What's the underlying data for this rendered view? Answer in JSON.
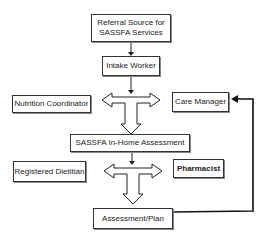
{
  "diagram": {
    "nodes": {
      "referral": {
        "label_line1": "Referral Source for",
        "label_line2": "SASSFA Services"
      },
      "intake": {
        "label": "Intake Worker"
      },
      "nutrition": {
        "label": "Nutrition Coordinator"
      },
      "care_manager": {
        "label": "Care Manager"
      },
      "assessment": {
        "label": "SASSFA In-Home Assessment"
      },
      "dietitian": {
        "label": "Registered Dietitian"
      },
      "pharmacist": {
        "label": "Pharmacist"
      },
      "plan": {
        "label": "Assessment/Plan"
      }
    },
    "edges": [
      {
        "from": "referral",
        "to": "intake"
      },
      {
        "from": "intake",
        "to": "t-junction-1"
      },
      {
        "from": "t-junction-1",
        "to": [
          "nutrition",
          "care_manager",
          "assessment"
        ]
      },
      {
        "from": "assessment",
        "to": "t-junction-2"
      },
      {
        "from": "t-junction-2",
        "to": [
          "dietitian",
          "pharmacist",
          "plan"
        ]
      },
      {
        "from": "plan",
        "to": "care_manager",
        "type": "feedback"
      }
    ]
  }
}
